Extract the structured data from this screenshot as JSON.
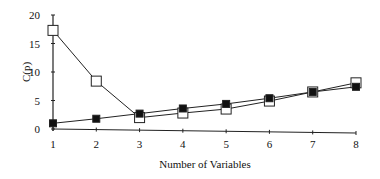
{
  "chart_data": {
    "type": "line",
    "title": "",
    "xlabel": "Number of Variables",
    "ylabel": "C(p)",
    "x": [
      1,
      2,
      3,
      4,
      5,
      6,
      7,
      8
    ],
    "xticks": [
      "1",
      "2",
      "3",
      "4",
      "5",
      "6",
      "7",
      "8"
    ],
    "yticks": [
      "0",
      "5",
      "10",
      "15",
      "20"
    ],
    "ylim": [
      0,
      20
    ],
    "xlim": [
      1,
      8
    ],
    "grid": false,
    "legend": null,
    "series": [
      {
        "name": "open squares",
        "marker": "open-square",
        "values": [
          17.3,
          8.4,
          2.0,
          2.8,
          3.5,
          4.9,
          6.5,
          8.1
        ]
      },
      {
        "name": "filled squares",
        "marker": "filled-square",
        "values": [
          1.0,
          1.8,
          2.7,
          3.6,
          4.4,
          5.4,
          6.5,
          7.4
        ]
      }
    ]
  }
}
